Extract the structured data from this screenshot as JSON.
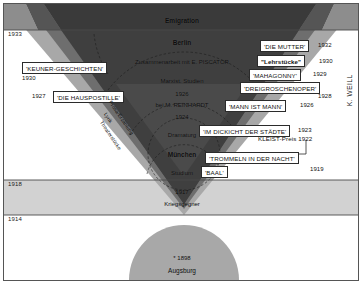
{
  "diagram": {
    "palette": {
      "band_dark": "#3a3a3a",
      "band_mid": "#6e6e6e",
      "band_light": "#a8a8a8",
      "band_pale": "#d2d2d2",
      "frame": "#555555",
      "ink": "#111111",
      "paper": "#ffffff"
    }
  },
  "year_ticks": [
    {
      "label": "1933",
      "y": 29
    },
    {
      "label": "1918",
      "y": 178
    },
    {
      "label": "1914",
      "y": 213
    }
  ],
  "center_stack": [
    {
      "label": "Emigration",
      "y": 17,
      "weight": "bold"
    },
    {
      "label": "Berlin",
      "y": 39,
      "weight": "bold"
    },
    {
      "label": "Zusammenarbeit mit E. PISCATOR",
      "y": 58,
      "weight": "normal"
    },
    {
      "label": "Marxist. Studien",
      "y": 77,
      "weight": "normal"
    },
    {
      "label": "1926",
      "y": 90,
      "weight": "normal"
    },
    {
      "label": "bei M. REINHARDT",
      "y": 101,
      "weight": "normal"
    },
    {
      "label": "1924",
      "y": 113,
      "weight": "normal"
    },
    {
      "label": "Dramaturg",
      "y": 131,
      "weight": "normal"
    },
    {
      "label": "München",
      "y": 151,
      "weight": "bold"
    },
    {
      "label": "Studium",
      "y": 169,
      "weight": "normal"
    },
    {
      "label": "1917",
      "y": 188,
      "weight": "normal"
    },
    {
      "label": "Kriegsgegner",
      "y": 200,
      "weight": "normal"
    }
  ],
  "works": [
    {
      "title": "'KEUNER-GESCHICHTEN'",
      "year": "1930",
      "side": "left",
      "box_x": 18,
      "box_y": 58,
      "year_x": 18,
      "year_y": 70,
      "bold": false
    },
    {
      "title": "'DIE HAUSPOSTILLE'",
      "year": "1927",
      "side": "left",
      "box_x": 49,
      "box_y": 87,
      "year_x": 31,
      "year_y": 89,
      "bold": false
    },
    {
      "title": "'DIE MUTTER'",
      "year": "1932",
      "side": "right",
      "box_x": 256,
      "box_y": 37,
      "year_x": 314,
      "year_y": 39,
      "bold": false
    },
    {
      "title": "\"Lehrstücke\"",
      "year": "1930",
      "side": "right",
      "box_x": 253,
      "box_y": 52,
      "year_x": 316,
      "year_y": 55,
      "bold": true
    },
    {
      "title": "'MAHAGONNY'",
      "year": "1929",
      "side": "right",
      "box_x": 246,
      "box_y": 66,
      "year_x": 310,
      "year_y": 68,
      "bold": false
    },
    {
      "title": "'DREIGROSCHENOPER'",
      "year": "1928",
      "side": "right",
      "box_x": 238,
      "box_y": 79,
      "year_x": 316,
      "year_y": 89,
      "bold": false
    },
    {
      "title": "'MANN IST MANN'",
      "year": "1926",
      "side": "right",
      "box_x": 222,
      "box_y": 97,
      "year_x": 298,
      "year_y": 99,
      "bold": false
    },
    {
      "title": "'IM DICKICHT DER STÄDTE'",
      "year": "1923",
      "side": "right",
      "box_x": 196,
      "box_y": 122,
      "year_x": 296,
      "year_y": 124,
      "bold": false
    },
    {
      "title": "'TROMMELN IN DER NACHT'",
      "year": "1919",
      "side": "right",
      "box_x": 202,
      "box_y": 149,
      "year_x": 308,
      "year_y": 163,
      "bold": false
    },
    {
      "title": "'BAAL'",
      "year": "",
      "side": "right",
      "box_x": 198,
      "box_y": 163,
      "year_x": 0,
      "year_y": 0,
      "bold": false
    }
  ],
  "annotations": {
    "kleist_prize": "KLEIST-Preis 1922",
    "weill": "K. WEILL",
    "birth": "* 1898",
    "birthplace": "Augsburg"
  },
  "genre_labels": [
    {
      "label": "Prosa/Erzählung",
      "x": 108,
      "y": 100
    },
    {
      "label": "Lyrik",
      "x": 104,
      "y": 110
    },
    {
      "label": "Theaterstücke",
      "x": 101,
      "y": 119
    }
  ]
}
